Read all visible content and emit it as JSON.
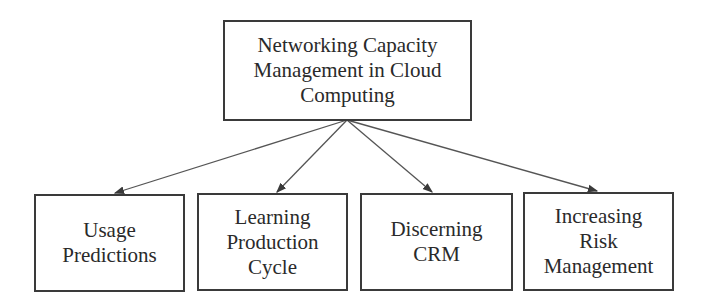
{
  "diagram": {
    "root": {
      "lines": [
        "Networking Capacity",
        "Management in Cloud",
        "Computing"
      ]
    },
    "children": [
      {
        "lines": [
          "Usage",
          "Predictions"
        ]
      },
      {
        "lines": [
          "Learning",
          "Production",
          "Cycle"
        ]
      },
      {
        "lines": [
          "Discerning",
          "CRM"
        ]
      },
      {
        "lines": [
          "Increasing",
          "Risk",
          "Management"
        ]
      }
    ],
    "colors": {
      "stroke": "#3a3a3a",
      "text": "#2a2a2a",
      "background": "#ffffff"
    }
  }
}
